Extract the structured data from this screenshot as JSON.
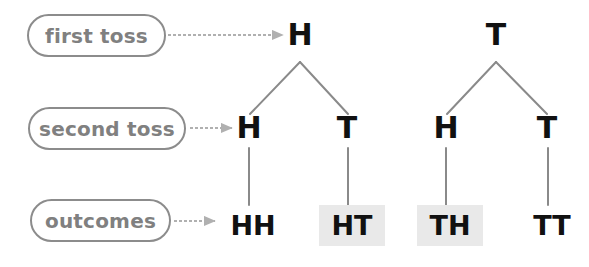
{
  "diagram": {
    "width": 589,
    "height": 267,
    "background_color": "#ffffff",
    "node_text_color": "#111111",
    "label_text_color": "#808080",
    "label_border_color": "#8c8c8c",
    "edge_color": "#8a8a8a",
    "arrow_color": "#b0b0b0",
    "highlight_color": "#e9e9e9"
  },
  "row_labels": [
    {
      "id": "first-toss",
      "text": "first toss",
      "x": 27,
      "y": 14,
      "w": 139,
      "h": 43,
      "font_size": 20
    },
    {
      "id": "second-toss",
      "text": "second toss",
      "x": 28,
      "y": 107,
      "w": 158,
      "h": 43,
      "font_size": 20
    },
    {
      "id": "outcomes",
      "text": "outcomes",
      "x": 30,
      "y": 199,
      "w": 141,
      "h": 43,
      "font_size": 20
    }
  ],
  "arrows": [
    {
      "id": "arrow-first-toss",
      "x1": 168,
      "y1": 35,
      "x2": 283,
      "y2": 35
    },
    {
      "id": "arrow-second-toss",
      "x1": 190,
      "y1": 128,
      "x2": 232,
      "y2": 128
    },
    {
      "id": "arrow-outcomes",
      "x1": 174,
      "y1": 221,
      "x2": 215,
      "y2": 221
    }
  ],
  "nodes": {
    "level1": [
      {
        "id": "root-h",
        "label": "H",
        "x": 300,
        "y": 35
      },
      {
        "id": "root-t",
        "label": "T",
        "x": 496,
        "y": 35
      }
    ],
    "level2": [
      {
        "id": "h-h",
        "label": "H",
        "x": 249,
        "y": 128
      },
      {
        "id": "h-t",
        "label": "T",
        "x": 347,
        "y": 128
      },
      {
        "id": "t-h",
        "label": "H",
        "x": 446,
        "y": 128
      },
      {
        "id": "t-t",
        "label": "T",
        "x": 547,
        "y": 128
      }
    ],
    "outcomes": [
      {
        "id": "outcome-hh",
        "label": "HH",
        "x": 249,
        "y": 222,
        "highlighted": false
      },
      {
        "id": "outcome-ht",
        "label": "HT",
        "x": 348,
        "y": 222,
        "highlighted": true
      },
      {
        "id": "outcome-th",
        "label": "TH",
        "x": 446,
        "y": 222,
        "highlighted": true
      },
      {
        "id": "outcome-tt",
        "label": "TT",
        "x": 548,
        "y": 222,
        "highlighted": false
      }
    ]
  },
  "edges": [
    {
      "id": "edge-root-h-to-h",
      "x1": 300,
      "y1": 62,
      "x2": 250,
      "y2": 114
    },
    {
      "id": "edge-root-h-to-t",
      "x1": 300,
      "y1": 62,
      "x2": 348,
      "y2": 114
    },
    {
      "id": "edge-root-t-to-h",
      "x1": 496,
      "y1": 62,
      "x2": 447,
      "y2": 114
    },
    {
      "id": "edge-root-t-to-t",
      "x1": 496,
      "y1": 62,
      "x2": 547,
      "y2": 114
    },
    {
      "id": "edge-h-to-hh",
      "x1": 249,
      "y1": 148,
      "x2": 249,
      "y2": 205
    },
    {
      "id": "edge-t-to-ht",
      "x1": 348,
      "y1": 148,
      "x2": 348,
      "y2": 205
    },
    {
      "id": "edge-h2-to-th",
      "x1": 446,
      "y1": 148,
      "x2": 446,
      "y2": 205
    },
    {
      "id": "edge-t2-to-tt",
      "x1": 548,
      "y1": 148,
      "x2": 548,
      "y2": 205
    }
  ]
}
